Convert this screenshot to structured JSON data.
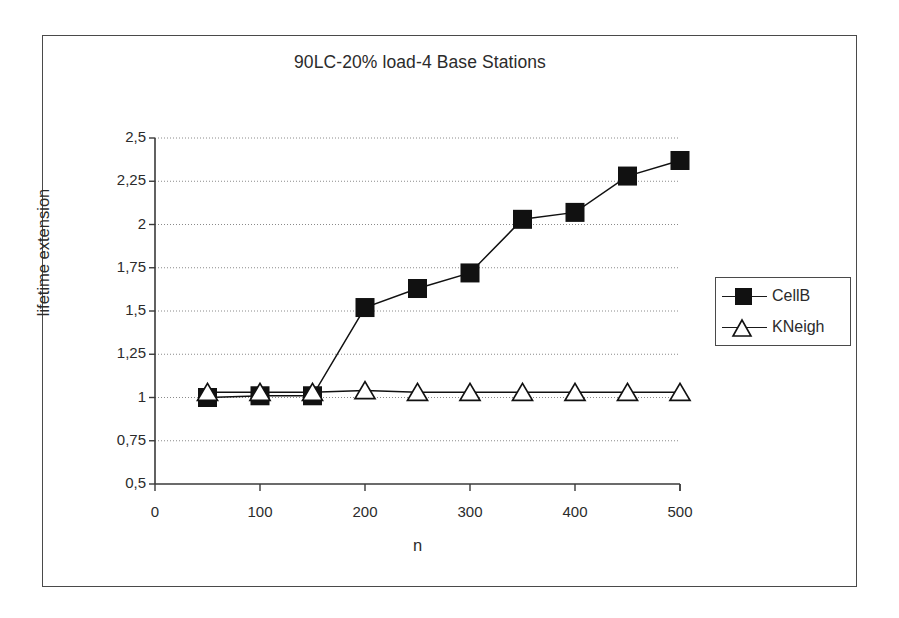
{
  "chart_data": {
    "type": "line",
    "title": "90LC-20% load-4 Base Stations",
    "xlabel": "n",
    "ylabel": "lifetime extension",
    "x": [
      50,
      100,
      150,
      200,
      250,
      300,
      350,
      400,
      450,
      500
    ],
    "xlim": [
      0,
      500
    ],
    "ylim": [
      0.5,
      2.5
    ],
    "grid": true,
    "grid_axis": "y",
    "legend_position": "right-outside",
    "xticks": [
      "0",
      "100",
      "200",
      "300",
      "400",
      "500"
    ],
    "xtick_values": [
      0,
      100,
      200,
      300,
      400,
      500
    ],
    "yticks": [
      "0,5",
      "0,75",
      "1",
      "1,25",
      "1,5",
      "1,75",
      "2",
      "2,25",
      "2,5"
    ],
    "ytick_values": [
      0.5,
      0.75,
      1,
      1.25,
      1.5,
      1.75,
      2,
      2.25,
      2.5
    ],
    "decimal_separator": ",",
    "series": [
      {
        "name": "CellB",
        "marker": "filled-square",
        "color": "#111111",
        "values": [
          1.0,
          1.01,
          1.01,
          1.52,
          1.63,
          1.72,
          2.03,
          2.07,
          2.28,
          2.37
        ]
      },
      {
        "name": "KNeigh",
        "marker": "hollow-triangle",
        "color": "#111111",
        "values": [
          1.03,
          1.03,
          1.03,
          1.04,
          1.03,
          1.03,
          1.03,
          1.03,
          1.03,
          1.03
        ]
      }
    ]
  },
  "legend": {
    "entries": [
      {
        "label": "CellB",
        "marker": "filled-square"
      },
      {
        "label": "KNeigh",
        "marker": "hollow-triangle"
      }
    ]
  }
}
